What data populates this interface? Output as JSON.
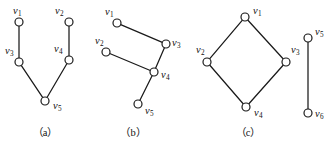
{
  "figure": {
    "width": 331,
    "height": 148,
    "background": "#ffffff",
    "ink_color": "#1a1a1a",
    "node_radius": 4,
    "panels": [
      {
        "id": "panel-a",
        "caption": "（a）",
        "caption_x": 45,
        "caption_y": 128,
        "vertices": [
          {
            "id": "v1",
            "label": "v",
            "sub": "1",
            "x": 19,
            "y": 22,
            "label_x": 13,
            "label_y": 6
          },
          {
            "id": "v2",
            "label": "v",
            "sub": "2",
            "x": 69,
            "y": 22,
            "label_x": 55,
            "label_y": 6
          },
          {
            "id": "v3",
            "label": "v",
            "sub": "3",
            "x": 19,
            "y": 62,
            "label_x": 5,
            "label_y": 46
          },
          {
            "id": "v4",
            "label": "v",
            "sub": "4",
            "x": 69,
            "y": 60,
            "label_x": 54,
            "label_y": 44
          },
          {
            "id": "v5",
            "label": "v",
            "sub": "5",
            "x": 45,
            "y": 101,
            "label_x": 53,
            "label_y": 101
          }
        ],
        "edges": [
          {
            "from": "v1",
            "to": "v3"
          },
          {
            "from": "v2",
            "to": "v4"
          },
          {
            "from": "v3",
            "to": "v5"
          },
          {
            "from": "v4",
            "to": "v5"
          }
        ]
      },
      {
        "id": "panel-b",
        "caption": "（b）",
        "caption_x": 133,
        "caption_y": 128,
        "vertices": [
          {
            "id": "v1",
            "label": "v",
            "sub": "1",
            "x": 117,
            "y": 23,
            "label_x": 105,
            "label_y": 7
          },
          {
            "id": "v2",
            "label": "v",
            "sub": "2",
            "x": 106,
            "y": 52,
            "label_x": 95,
            "label_y": 36
          },
          {
            "id": "v3",
            "label": "v",
            "sub": "3",
            "x": 166,
            "y": 44,
            "label_x": 172,
            "label_y": 38
          },
          {
            "id": "v4",
            "label": "v",
            "sub": "4",
            "x": 154,
            "y": 72,
            "label_x": 161,
            "label_y": 70
          },
          {
            "id": "v5",
            "label": "v",
            "sub": "5",
            "x": 138,
            "y": 104,
            "label_x": 145,
            "label_y": 106
          }
        ],
        "edges": [
          {
            "from": "v1",
            "to": "v3"
          },
          {
            "from": "v2",
            "to": "v4"
          },
          {
            "from": "v3",
            "to": "v4"
          },
          {
            "from": "v4",
            "to": "v5"
          }
        ]
      },
      {
        "id": "panel-c",
        "caption": "（c）",
        "caption_x": 248,
        "caption_y": 128,
        "vertices": [
          {
            "id": "v1",
            "label": "v",
            "sub": "1",
            "x": 245,
            "y": 17,
            "label_x": 253,
            "label_y": 6
          },
          {
            "id": "v2",
            "label": "v",
            "sub": "2",
            "x": 207,
            "y": 62,
            "label_x": 196,
            "label_y": 45
          },
          {
            "id": "v3",
            "label": "v",
            "sub": "3",
            "x": 286,
            "y": 62,
            "label_x": 291,
            "label_y": 45
          },
          {
            "id": "v4",
            "label": "v",
            "sub": "4",
            "x": 246,
            "y": 107,
            "label_x": 254,
            "label_y": 108
          },
          {
            "id": "v5",
            "label": "v",
            "sub": "5",
            "x": 308,
            "y": 38,
            "label_x": 315,
            "label_y": 27
          },
          {
            "id": "v6",
            "label": "v",
            "sub": "6",
            "x": 308,
            "y": 113,
            "label_x": 315,
            "label_y": 109
          }
        ],
        "edges": [
          {
            "from": "v1",
            "to": "v2"
          },
          {
            "from": "v1",
            "to": "v3"
          },
          {
            "from": "v2",
            "to": "v4"
          },
          {
            "from": "v3",
            "to": "v4"
          },
          {
            "from": "v5",
            "to": "v6"
          }
        ]
      }
    ]
  }
}
